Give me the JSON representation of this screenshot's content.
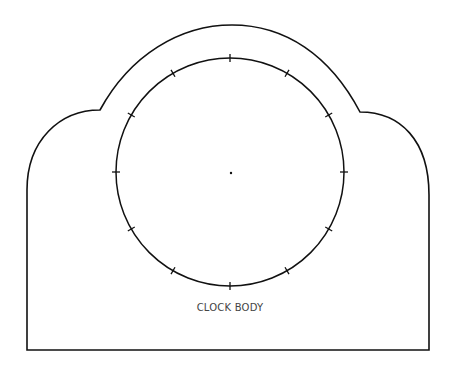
{
  "diagram": {
    "label": "CLOCK BODY",
    "stroke_color": "#111111",
    "dial": {
      "center": [
        230,
        172
      ],
      "radius": 114,
      "tick_count": 12
    },
    "outline": {
      "left": 27,
      "right": 429,
      "bottom": 350,
      "arch_top": 25
    }
  }
}
